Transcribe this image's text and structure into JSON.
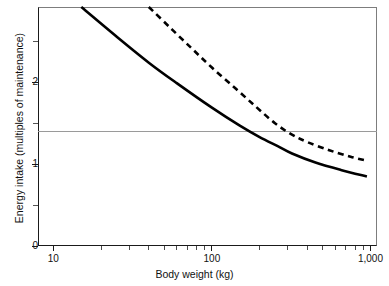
{
  "chart_data": {
    "type": "line",
    "title": "",
    "xlabel": "Body weight (kg)",
    "ylabel": "Energy intake (multiples of maintenance)",
    "xscale": "log",
    "yscale": "linear",
    "xlim": [
      8,
      1100
    ],
    "ylim": [
      0,
      2.92
    ],
    "grid": false,
    "legend": "none",
    "x_tick_labels": [
      "10",
      "100",
      "1,000"
    ],
    "x_tick_values": [
      10,
      100,
      1000
    ],
    "x_minor_ticks": [
      20,
      30,
      40,
      50,
      60,
      70,
      80,
      90,
      200,
      300,
      400,
      500,
      600,
      700,
      800,
      900
    ],
    "y_tick_labels": [
      "0",
      "1",
      "2"
    ],
    "y_tick_values": [
      0,
      1,
      2
    ],
    "y_minor_ticks": [
      0.5,
      1.5,
      2.5
    ],
    "annotations": [
      {
        "name": "reference-line",
        "type": "hline",
        "y": 1.23,
        "color": "#9a9a9a"
      }
    ],
    "series": [
      {
        "name": "solid-curve",
        "style": "solid",
        "color": "#000000",
        "points": [
          {
            "x": 15,
            "y": 2.92
          },
          {
            "x": 25,
            "y": 2.56
          },
          {
            "x": 40,
            "y": 2.24
          },
          {
            "x": 60,
            "y": 1.99
          },
          {
            "x": 100,
            "y": 1.69
          },
          {
            "x": 150,
            "y": 1.47
          },
          {
            "x": 200,
            "y": 1.33
          },
          {
            "x": 260,
            "y": 1.22
          },
          {
            "x": 320,
            "y": 1.13
          },
          {
            "x": 450,
            "y": 1.02
          },
          {
            "x": 650,
            "y": 0.93
          },
          {
            "x": 950,
            "y": 0.85
          }
        ]
      },
      {
        "name": "dashed-curve",
        "style": "dashed",
        "color": "#000000",
        "points": [
          {
            "x": 40,
            "y": 2.92
          },
          {
            "x": 55,
            "y": 2.66
          },
          {
            "x": 75,
            "y": 2.41
          },
          {
            "x": 100,
            "y": 2.18
          },
          {
            "x": 140,
            "y": 1.93
          },
          {
            "x": 190,
            "y": 1.7
          },
          {
            "x": 250,
            "y": 1.5
          },
          {
            "x": 320,
            "y": 1.36
          },
          {
            "x": 400,
            "y": 1.27
          },
          {
            "x": 550,
            "y": 1.17
          },
          {
            "x": 750,
            "y": 1.09
          },
          {
            "x": 960,
            "y": 1.04
          }
        ]
      }
    ]
  },
  "axes": {
    "y": {
      "title": "Energy intake (multiples of maintenance)",
      "labels": [
        {
          "text": "2",
          "value": 2
        },
        {
          "text": "1",
          "value": 1
        },
        {
          "text": "0",
          "value": 0
        }
      ]
    },
    "x": {
      "title": "Body weight (kg)",
      "labels": [
        {
          "text": "10",
          "value": 10
        },
        {
          "text": "100",
          "value": 100
        },
        {
          "text": "1,000",
          "value": 1000
        }
      ]
    }
  }
}
